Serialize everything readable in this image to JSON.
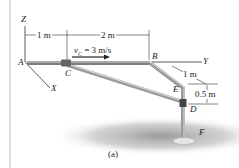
{
  "figure": {
    "caption": "(a)",
    "points": {
      "A": "A",
      "B": "B",
      "C": "C",
      "D": "D",
      "E": "E",
      "F": "F"
    },
    "axes": {
      "x": "X",
      "y": "Y",
      "z": "Z"
    },
    "dimensions": {
      "ac": "1 m",
      "cb": "2 m",
      "bd": "1 m",
      "ed": "0.5 m"
    },
    "velocity": {
      "label": "v",
      "subscript": "C",
      "value": "= 3 m/s"
    },
    "colors": {
      "rod": "#8a8a8a",
      "rod_light": "#cfcfcf",
      "shadow": "#9a9a9a",
      "text": "#222222"
    }
  }
}
